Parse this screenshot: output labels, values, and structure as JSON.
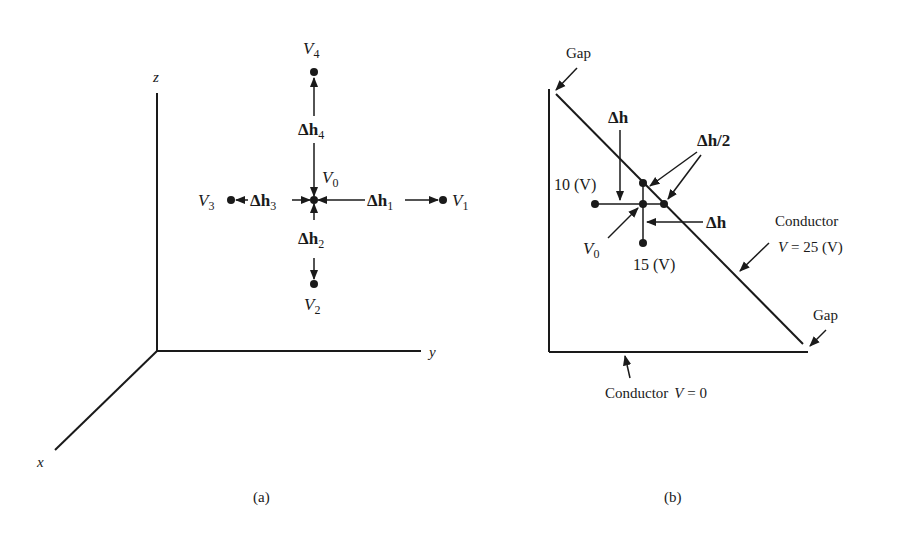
{
  "figure_a": {
    "caption": "(a)",
    "axes": {
      "x": "x",
      "y": "y",
      "z": "z"
    },
    "nodes": {
      "V0": {
        "main": "V",
        "sub": "0"
      },
      "V1": {
        "main": "V",
        "sub": "1"
      },
      "V2": {
        "main": "V",
        "sub": "2"
      },
      "V3": {
        "main": "V",
        "sub": "3"
      },
      "V4": {
        "main": "V",
        "sub": "4"
      }
    },
    "spacings": {
      "dh1": {
        "main": "Δh",
        "sub": "1"
      },
      "dh2": {
        "main": "Δh",
        "sub": "2"
      },
      "dh3": {
        "main": "Δh",
        "sub": "3"
      },
      "dh4": {
        "main": "Δh",
        "sub": "4"
      }
    }
  },
  "figure_b": {
    "caption": "(b)",
    "gap_top": "Gap",
    "gap_bottom": "Gap",
    "dh_top": "Δh",
    "dh_right": "Δh",
    "dh_half": "Δh/2",
    "left_value": "10 (V)",
    "bottom_value": "15 (V)",
    "node": {
      "main": "V",
      "sub": "0"
    },
    "conductor_diag": {
      "line1": "Conductor",
      "line2_var": "V",
      "line2_rest": " = 25 (V)"
    },
    "conductor_bottom": {
      "word": "Conductor",
      "var": "V",
      "rest": " = 0"
    }
  }
}
